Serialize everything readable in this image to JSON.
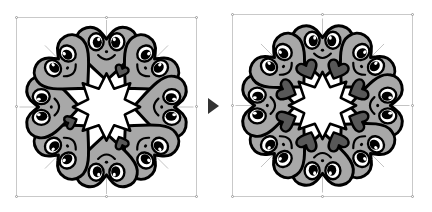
{
  "scene": {
    "type": "vector-editor-before-after",
    "background_color": "#ffffff",
    "panel_count": 2
  },
  "arrow": {
    "name": "transition-arrow",
    "glyph": "play-triangle-right",
    "color": "#333333",
    "label": "becomes",
    "x": 208,
    "y": 98
  },
  "panels": [
    {
      "id": "before",
      "label": "Before",
      "selection_box": {
        "x": 16,
        "y": 17,
        "width": 181,
        "height": 180
      },
      "selection": {
        "border_color": "#c9c9c9",
        "handle_fill": "#ffffff",
        "handle_stroke": "#9a9a9a",
        "handle_count": 8,
        "handles": [
          "nw",
          "n",
          "ne",
          "w",
          "e",
          "sw",
          "s",
          "se"
        ]
      },
      "artwork": {
        "name": "heart-character-wreath",
        "description": "Eight smiling cartoon heart characters arranged in a radial ring around a white star-shaped negative space.",
        "character_count": 8,
        "rotation_step_degrees": 45,
        "center": {
          "x": 92,
          "y": 106
        },
        "ring_radius": 56,
        "character": {
          "body_fill": "#a8a8a8",
          "body_stroke": "#000000",
          "stroke_width": 3,
          "eye_white": "#ffffff",
          "pupil_color": "#000000",
          "mouth_color": "#000000",
          "nose_color": "#000000",
          "eye_count": 2
        },
        "accent_hearts": {
          "name": "small-dark-heart",
          "count": 3,
          "fill": "#585858",
          "stroke": "#000000",
          "size": 13
        },
        "guide_lines": {
          "visible": true,
          "color": "#8c8c8c",
          "style": "thin-radial-spokes"
        },
        "center_shape": {
          "name": "star-negative-space",
          "points": 8,
          "fill": "#ffffff"
        }
      }
    },
    {
      "id": "after",
      "label": "After",
      "selection_box": {
        "x": 232,
        "y": 14,
        "width": 181,
        "height": 183
      },
      "selection": {
        "border_color": "#c9c9c9",
        "handle_fill": "#ffffff",
        "handle_stroke": "#9a9a9a",
        "handle_count": 8,
        "handles": [
          "nw",
          "n",
          "ne",
          "w",
          "e",
          "sw",
          "s",
          "se"
        ]
      },
      "artwork": {
        "name": "heart-character-wreath-with-dark-hearts",
        "description": "Same eight-character heart wreath, now with eight large dark hearts placed at every junction between neighbouring characters.",
        "character_count": 8,
        "rotation_step_degrees": 45,
        "center": {
          "x": 322,
          "y": 104
        },
        "ring_radius": 56,
        "character": {
          "body_fill": "#a8a8a8",
          "body_stroke": "#000000",
          "stroke_width": 3,
          "eye_white": "#ffffff",
          "pupil_color": "#000000",
          "mouth_color": "#000000",
          "nose_color": "#000000",
          "eye_count": 2
        },
        "accent_hearts": {
          "name": "large-dark-heart",
          "count": 8,
          "fill": "#585858",
          "stroke": "#000000",
          "size": 20
        },
        "guide_lines": {
          "visible": true,
          "color": "#8c8c8c",
          "style": "thin-radial-spokes"
        },
        "center_shape": {
          "name": "star-negative-space",
          "points": 8,
          "fill": "#ffffff"
        }
      }
    }
  ]
}
